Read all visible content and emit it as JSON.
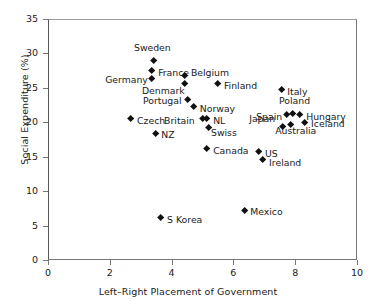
{
  "chart_data": {
    "type": "scatter",
    "title": "",
    "xlabel": "Left–Right Placement of Government",
    "ylabel": "Social Expenditure (%)",
    "xlim": [
      0,
      10
    ],
    "ylim": [
      0,
      35
    ],
    "xticks": [
      0,
      2,
      4,
      6,
      8,
      10
    ],
    "yticks": [
      0,
      5,
      10,
      15,
      20,
      25,
      30,
      35
    ],
    "grid": false,
    "legend": false,
    "marker": "diamond",
    "marker_color": "#111111",
    "points": [
      {
        "label": "Sweden",
        "x": 3.43,
        "y": 28.9,
        "lx": -20,
        "ly": -14
      },
      {
        "label": "France",
        "x": 3.37,
        "y": 27.5,
        "lx": 6,
        "ly": 1
      },
      {
        "label": "Germany",
        "x": 3.37,
        "y": 26.4,
        "lx": -47,
        "ly": 1
      },
      {
        "label": "Belgium",
        "x": 4.43,
        "y": 26.7,
        "lx": 6,
        "ly": -4
      },
      {
        "label": "Denmark",
        "x": 4.43,
        "y": 25.6,
        "lx": -43,
        "ly": 6
      },
      {
        "label": "Finland",
        "x": 5.5,
        "y": 25.6,
        "lx": 6,
        "ly": 1
      },
      {
        "label": "Portugal",
        "x": 4.53,
        "y": 23.3,
        "lx": -45,
        "ly": 0
      },
      {
        "label": "Italy",
        "x": 7.55,
        "y": 24.7,
        "lx": 6,
        "ly": 1
      },
      {
        "label": "Norway",
        "x": 4.72,
        "y": 22.2,
        "lx": 6,
        "ly": 1
      },
      {
        "label": "Poland",
        "x": 7.93,
        "y": 21.3,
        "lx": -14,
        "ly": -13
      },
      {
        "label": "Spain",
        "x": 7.74,
        "y": 21.1,
        "lx": -31,
        "ly": 1
      },
      {
        "label": "Hungary",
        "x": 8.16,
        "y": 21.1,
        "lx": 6,
        "ly": 1
      },
      {
        "label": "Czech",
        "x": 2.69,
        "y": 20.5,
        "lx": 6,
        "ly": 1
      },
      {
        "label": "Britain",
        "x": 5.02,
        "y": 20.5,
        "lx": -39,
        "ly": 1
      },
      {
        "label": "NL",
        "x": 5.15,
        "y": 20.5,
        "lx": 6,
        "ly": 1
      },
      {
        "label": "Japan",
        "x": 7.61,
        "y": 19.3,
        "lx": -34,
        "ly": -9
      },
      {
        "label": "Swiss",
        "x": 5.21,
        "y": 19.2,
        "lx": 2,
        "ly": 4
      },
      {
        "label": "Iceland",
        "x": 8.32,
        "y": 19.9,
        "lx": 6,
        "ly": 0
      },
      {
        "label": "Australia",
        "x": 7.87,
        "y": 19.6,
        "lx": -16,
        "ly": 5
      },
      {
        "label": "NZ",
        "x": 3.47,
        "y": 18.4,
        "lx": 6,
        "ly": 1
      },
      {
        "label": "Canada",
        "x": 5.15,
        "y": 16.1,
        "lx": 6,
        "ly": 1
      },
      {
        "label": "US",
        "x": 6.83,
        "y": 15.7,
        "lx": 6,
        "ly": 1
      },
      {
        "label": "Ireland",
        "x": 6.96,
        "y": 14.5,
        "lx": 6,
        "ly": 2
      },
      {
        "label": "Mexico",
        "x": 6.35,
        "y": 7.2,
        "lx": 6,
        "ly": 1
      },
      {
        "label": "S Korea",
        "x": 3.66,
        "y": 6.1,
        "lx": 6,
        "ly": 1
      }
    ]
  }
}
